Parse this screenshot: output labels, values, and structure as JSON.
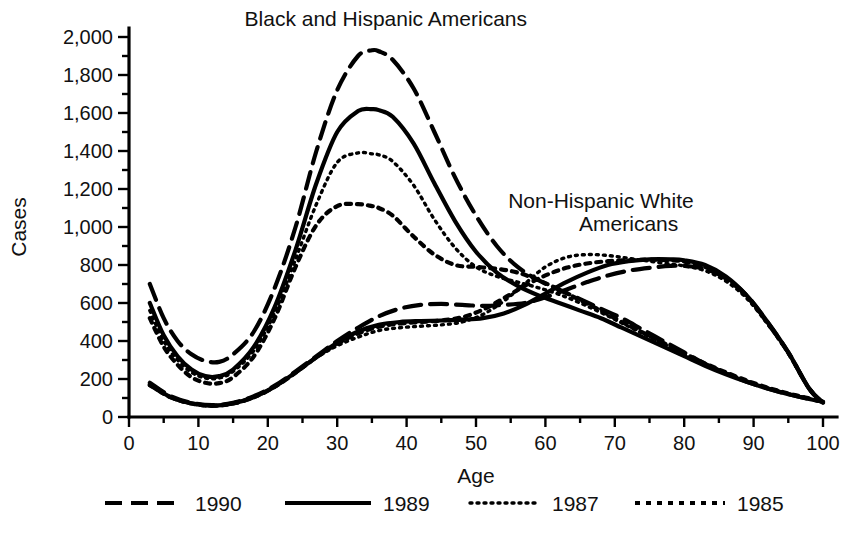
{
  "chart_data": {
    "type": "line",
    "title": "",
    "xlabel": "Age",
    "ylabel": "Cases",
    "xlim": [
      0,
      100
    ],
    "ylim": [
      0,
      2000
    ],
    "grid": false,
    "legend_position": "bottom",
    "x_ticks": [
      0,
      10,
      20,
      30,
      40,
      50,
      60,
      70,
      80,
      90,
      100
    ],
    "x_tick_labels": [
      "0",
      "10",
      "20",
      "30",
      "40",
      "50",
      "60",
      "70",
      "80",
      "90",
      "100"
    ],
    "x_minor_tick_interval": 5,
    "y_ticks": [
      0,
      200,
      400,
      600,
      800,
      1000,
      1200,
      1400,
      1600,
      1800,
      2000
    ],
    "y_tick_labels": [
      "0",
      "200",
      "400",
      "600",
      "800",
      "1,000",
      "1,200",
      "1,400",
      "1,600",
      "1,800",
      "2,000"
    ],
    "y_minor_tick_interval": 100,
    "annotations": [
      {
        "name": "black-hispanic-group-label",
        "text": "Black and Hispanic Americans",
        "x": 37,
        "y": 2060,
        "anchor": "middle"
      },
      {
        "name": "non-hispanic-white-group-label-line1",
        "text": "Non-Hispanic White",
        "x": 68,
        "y": 1100,
        "anchor": "middle"
      },
      {
        "name": "non-hispanic-white-group-label-line2",
        "text": "Americans",
        "x": 72,
        "y": 980,
        "anchor": "middle"
      }
    ],
    "legend": [
      {
        "label": "1990",
        "style": "long-dash",
        "dasharray": "17,9",
        "width": 4.2
      },
      {
        "label": "1989",
        "style": "solid",
        "dasharray": "none",
        "width": 4.2
      },
      {
        "label": "1987",
        "style": "fine-dotted",
        "dasharray": "2,5",
        "width": 3.4
      },
      {
        "label": "1985",
        "style": "dotted",
        "dasharray": "5,6",
        "width": 4.2
      }
    ],
    "groups": [
      {
        "name": "Black and Hispanic Americans",
        "series": [
          {
            "name": "1990",
            "style": "long-dash",
            "x": [
              3,
              5,
              7,
              9,
              11,
              13,
              15,
              18,
              21,
              24,
              27,
              30,
              33,
              35,
              36,
              38,
              41,
              44,
              47,
              50,
              53,
              56,
              59,
              62,
              65,
              68,
              71,
              74,
              77,
              80,
              83,
              86,
              89,
              92,
              95,
              98,
              100
            ],
            "y": [
              700,
              520,
              400,
              330,
              295,
              290,
              330,
              450,
              680,
              1000,
              1400,
              1720,
              1900,
              1930,
              1925,
              1880,
              1730,
              1500,
              1260,
              1060,
              900,
              790,
              720,
              670,
              620,
              570,
              520,
              460,
              400,
              340,
              280,
              230,
              185,
              150,
              120,
              95,
              80
            ]
          },
          {
            "name": "1989",
            "style": "solid",
            "x": [
              3,
              5,
              7,
              9,
              11,
              13,
              15,
              18,
              21,
              24,
              27,
              30,
              33,
              35,
              36,
              38,
              41,
              44,
              47,
              50,
              53,
              56,
              59,
              62,
              65,
              68,
              71,
              74,
              77,
              80,
              83,
              86,
              89,
              92,
              95,
              98,
              100
            ],
            "y": [
              600,
              430,
              320,
              250,
              215,
              215,
              250,
              370,
              580,
              880,
              1230,
              1500,
              1610,
              1620,
              1615,
              1580,
              1440,
              1230,
              1030,
              870,
              760,
              690,
              640,
              600,
              560,
              520,
              470,
              420,
              370,
              320,
              270,
              225,
              185,
              150,
              120,
              95,
              80
            ]
          },
          {
            "name": "1987",
            "style": "fine-dotted",
            "x": [
              3,
              5,
              7,
              9,
              11,
              13,
              15,
              18,
              21,
              24,
              27,
              30,
              33,
              35,
              36,
              38,
              41,
              44,
              47,
              50,
              53,
              56,
              59,
              62,
              65,
              68,
              71,
              74,
              77,
              80,
              83,
              86,
              89,
              92,
              95,
              98,
              100
            ],
            "y": [
              560,
              400,
              300,
              235,
              205,
              205,
              240,
              350,
              550,
              830,
              1120,
              1340,
              1390,
              1385,
              1380,
              1345,
              1220,
              1040,
              890,
              790,
              740,
              710,
              680,
              645,
              600,
              550,
              495,
              440,
              385,
              330,
              280,
              232,
              190,
              152,
              122,
              96,
              80
            ]
          },
          {
            "name": "1985",
            "style": "dotted",
            "x": [
              3,
              5,
              7,
              9,
              11,
              13,
              15,
              18,
              21,
              24,
              27,
              30,
              33,
              35,
              36,
              38,
              41,
              44,
              47,
              50,
              53,
              56,
              59,
              62,
              65,
              68,
              71,
              74,
              77,
              80,
              83,
              86,
              89,
              92,
              95,
              98,
              100
            ],
            "y": [
              520,
              370,
              275,
              210,
              180,
              178,
              210,
              320,
              520,
              790,
              1010,
              1110,
              1120,
              1110,
              1100,
              1060,
              950,
              855,
              800,
              790,
              780,
              760,
              720,
              670,
              615,
              560,
              500,
              445,
              390,
              335,
              282,
              235,
              192,
              155,
              124,
              98,
              80
            ]
          }
        ]
      },
      {
        "name": "Non-Hispanic White Americans",
        "series": [
          {
            "name": "1990",
            "style": "long-dash",
            "x": [
              3,
              6,
              9,
              12,
              15,
              18,
              21,
              24,
              27,
              30,
              33,
              36,
              39,
              42,
              45,
              48,
              51,
              54,
              57,
              60,
              63,
              66,
              69,
              72,
              75,
              78,
              80,
              83,
              86,
              89,
              92,
              95,
              98,
              100
            ],
            "y": [
              180,
              110,
              75,
              62,
              75,
              110,
              165,
              240,
              320,
              400,
              470,
              530,
              570,
              590,
              595,
              590,
              585,
              590,
              600,
              630,
              670,
              710,
              745,
              770,
              785,
              795,
              795,
              780,
              730,
              640,
              500,
              340,
              150,
              75
            ]
          },
          {
            "name": "1989",
            "style": "solid",
            "x": [
              3,
              6,
              9,
              12,
              15,
              18,
              21,
              24,
              27,
              30,
              33,
              36,
              39,
              42,
              45,
              48,
              51,
              54,
              57,
              60,
              63,
              66,
              69,
              72,
              75,
              78,
              80,
              83,
              86,
              89,
              92,
              95,
              98,
              100
            ],
            "y": [
              170,
              105,
              72,
              60,
              72,
              105,
              160,
              235,
              315,
              390,
              450,
              485,
              500,
              505,
              508,
              512,
              520,
              545,
              590,
              650,
              710,
              760,
              800,
              820,
              830,
              830,
              825,
              800,
              740,
              640,
              500,
              340,
              150,
              75
            ]
          },
          {
            "name": "1987",
            "style": "fine-dotted",
            "x": [
              3,
              6,
              9,
              12,
              15,
              18,
              21,
              24,
              27,
              30,
              33,
              36,
              39,
              42,
              45,
              48,
              51,
              54,
              57,
              60,
              63,
              66,
              69,
              72,
              75,
              78,
              80,
              83,
              86,
              89,
              92,
              95,
              98,
              100
            ],
            "y": [
              165,
              102,
              70,
              58,
              70,
              103,
              158,
              232,
              312,
              375,
              420,
              455,
              470,
              478,
              485,
              500,
              540,
              610,
              700,
              790,
              840,
              855,
              850,
              835,
              820,
              805,
              795,
              770,
              715,
              625,
              490,
              335,
              148,
              75
            ]
          },
          {
            "name": "1985",
            "style": "dotted",
            "x": [
              3,
              6,
              9,
              12,
              15,
              18,
              21,
              24,
              27,
              30,
              33,
              36,
              39,
              42,
              45,
              48,
              51,
              54,
              57,
              60,
              63,
              66,
              69,
              72,
              75,
              78,
              80,
              83,
              86,
              89,
              92,
              95,
              98,
              100
            ],
            "y": [
              168,
              104,
              71,
              59,
              71,
              104,
              159,
              233,
              314,
              385,
              440,
              475,
              492,
              500,
              508,
              525,
              565,
              625,
              690,
              745,
              785,
              808,
              820,
              825,
              828,
              825,
              818,
              790,
              730,
              635,
              495,
              338,
              150,
              75
            ]
          }
        ]
      }
    ]
  }
}
